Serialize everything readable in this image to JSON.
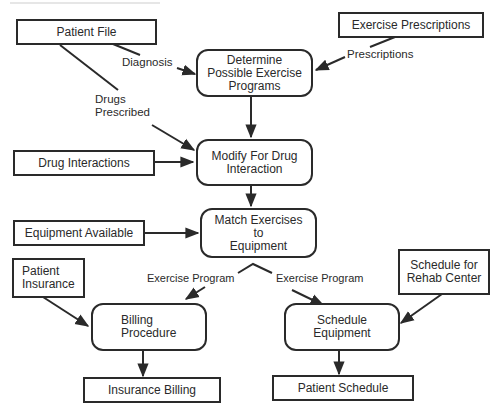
{
  "diagram": {
    "type": "data-flow",
    "external_entities": {
      "patient_file": "Patient File",
      "exercise_prescriptions": "Exercise Prescriptions",
      "drug_interactions": "Drug Interactions",
      "equipment_available": "Equipment Available",
      "patient_insurance": "Patient\nInsurance",
      "schedule_rehab": "Schedule for\nRehab Center",
      "insurance_billing": "Insurance Billing",
      "patient_schedule": "Patient Schedule"
    },
    "processes": {
      "determine_programs": "Determine\nPossible Exercise\nPrograms",
      "modify_drug": "Modify For Drug\nInteraction",
      "match_exercises": "Match Exercises\nto\nEquipment",
      "billing_procedure": "Billing\nProcedure",
      "schedule_equipment": "Schedule\nEquipment"
    },
    "flow_labels": {
      "diagnosis": "Diagnosis",
      "prescriptions": "Prescriptions",
      "drugs_prescribed": "Drugs\nPrescribed",
      "exercise_program_left": "Exercise Program",
      "exercise_program_right": "Exercise Program"
    },
    "edges": [
      {
        "from": "Patient File",
        "to": "Determine Possible Exercise Programs",
        "label": "Diagnosis"
      },
      {
        "from": "Exercise Prescriptions",
        "to": "Determine Possible Exercise Programs",
        "label": "Prescriptions"
      },
      {
        "from": "Patient File",
        "to": "Modify For Drug Interaction",
        "label": "Drugs Prescribed"
      },
      {
        "from": "Determine Possible Exercise Programs",
        "to": "Modify For Drug Interaction",
        "label": ""
      },
      {
        "from": "Drug Interactions",
        "to": "Modify For Drug Interaction",
        "label": ""
      },
      {
        "from": "Modify For Drug Interaction",
        "to": "Match Exercises to Equipment",
        "label": ""
      },
      {
        "from": "Equipment Available",
        "to": "Match Exercises to Equipment",
        "label": ""
      },
      {
        "from": "Match Exercises to Equipment",
        "to": "Billing Procedure",
        "label": "Exercise Program"
      },
      {
        "from": "Match Exercises to Equipment",
        "to": "Schedule Equipment",
        "label": "Exercise Program"
      },
      {
        "from": "Patient Insurance",
        "to": "Billing Procedure",
        "label": ""
      },
      {
        "from": "Schedule for Rehab Center",
        "to": "Schedule Equipment",
        "label": ""
      },
      {
        "from": "Billing Procedure",
        "to": "Insurance Billing",
        "label": ""
      },
      {
        "from": "Schedule Equipment",
        "to": "Patient Schedule",
        "label": ""
      }
    ],
    "colors": {
      "ink": "#2a2a2a",
      "background": "#ffffff"
    }
  }
}
